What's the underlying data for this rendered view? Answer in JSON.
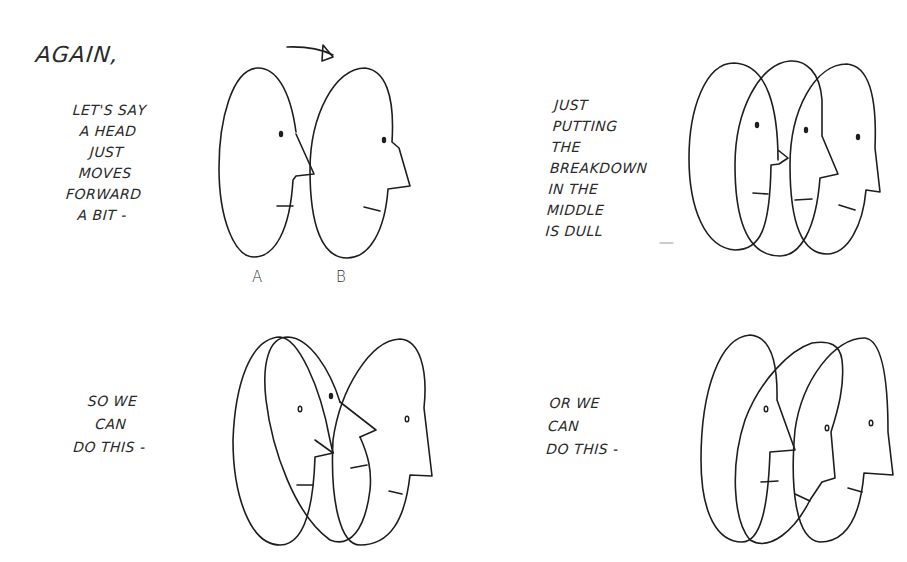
{
  "title": "Again,",
  "panels": [
    {
      "id": "panel-1",
      "caption": "Let's say\na head\njust\nmoves\nforward\na bit -",
      "labels": [
        "A",
        "B"
      ],
      "drawing": "two-heads-key-poses-with-arrow"
    },
    {
      "id": "panel-2",
      "caption": "Just\nputting\nthe\nbreakdown\nin the\nmiddle\nis dull",
      "trailing_mark": "---",
      "drawing": "three-heads-evenly-spaced-breakdown"
    },
    {
      "id": "panel-3",
      "caption": "So we\ncan\ndo this -",
      "drawing": "breakdown-head-tilted-back"
    },
    {
      "id": "panel-4",
      "caption": "Or we\ncan\ndo this -",
      "drawing": "breakdown-head-tilted-forward"
    }
  ],
  "icons": {
    "arrow": "curved-arrow-right"
  },
  "colors": {
    "ink": "#1e1e1e",
    "paper": "#ffffff"
  }
}
